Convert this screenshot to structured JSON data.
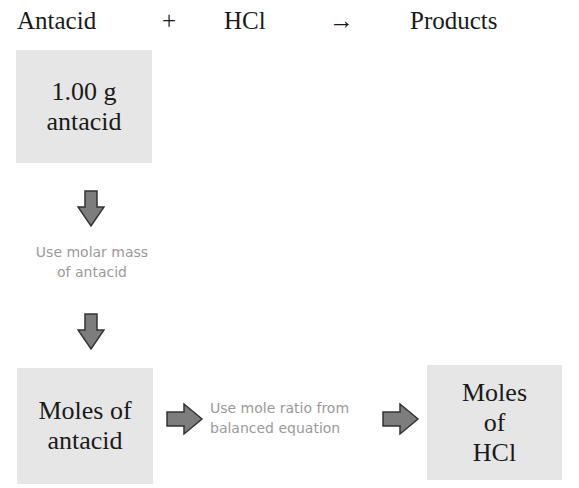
{
  "equation": {
    "reactant1": "Antacid",
    "plus": "+",
    "reactant2": "HCl",
    "yields": "→",
    "product": "Products"
  },
  "boxes": {
    "start": {
      "line1": "1.00 g",
      "line2": "antacid"
    },
    "moles_antacid": {
      "line1": "Moles of",
      "line2": "antacid"
    },
    "moles_hcl": {
      "line1": "Moles",
      "line2": "of",
      "line3": "HCl"
    }
  },
  "steps": {
    "step1": {
      "line1": "Use molar mass",
      "line2": "of antacid"
    },
    "step2": {
      "line1": "Use mole ratio from",
      "line2": "balanced equation"
    }
  },
  "colors": {
    "box_fill": "#e6e6e6",
    "arrow_fill": "#7d7d7d",
    "arrow_stroke": "#333333",
    "note_text": "#9a9a9a"
  }
}
